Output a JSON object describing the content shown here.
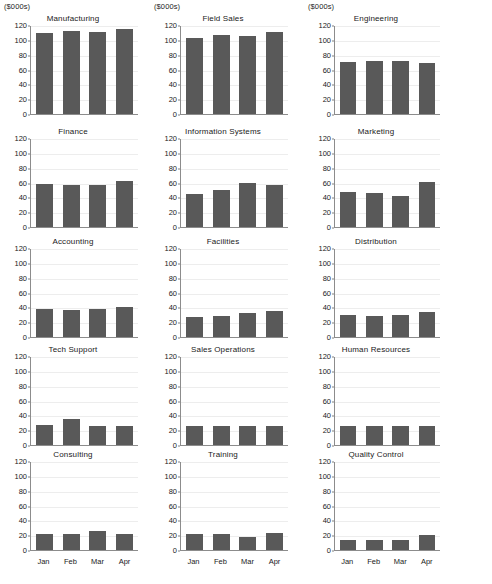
{
  "figure": {
    "units_label": "($000s)",
    "bar_color": "#595959",
    "grid_color": "#ededed",
    "axis_color": "#8c8c8c",
    "background": "#ffffff"
  },
  "chart_data": {
    "type": "bar",
    "title": "",
    "xlabel": "",
    "ylabel": "($000s)",
    "ylim": [
      0,
      120
    ],
    "yticks": [
      0,
      20,
      40,
      60,
      80,
      100,
      120
    ],
    "grid": true,
    "legend": "none",
    "categories": [
      "Jan",
      "Feb",
      "Mar",
      "Apr"
    ],
    "panels": [
      {
        "title": "Manufacturing",
        "values": [
          109,
          112,
          111,
          114
        ]
      },
      {
        "title": "Field Sales",
        "values": [
          103,
          106,
          105,
          110
        ]
      },
      {
        "title": "Engineering",
        "values": [
          70,
          72,
          71,
          69
        ]
      },
      {
        "title": "Finance",
        "values": [
          58,
          57,
          56,
          62
        ]
      },
      {
        "title": "Information Systems",
        "values": [
          44,
          50,
          59,
          56
        ]
      },
      {
        "title": "Marketing",
        "values": [
          47,
          46,
          42,
          61
        ]
      },
      {
        "title": "Accounting",
        "values": [
          38,
          36,
          38,
          41
        ]
      },
      {
        "title": "Facilities",
        "values": [
          27,
          28,
          33,
          35
        ]
      },
      {
        "title": "Distribution",
        "values": [
          30,
          29,
          30,
          34
        ]
      },
      {
        "title": "Tech Support",
        "values": [
          27,
          35,
          25,
          25
        ]
      },
      {
        "title": "Sales Operations",
        "values": [
          25,
          25,
          26,
          26
        ]
      },
      {
        "title": "Human Resources",
        "values": [
          25,
          25,
          26,
          26
        ]
      },
      {
        "title": "Consulting",
        "values": [
          21,
          22,
          25,
          21
        ]
      },
      {
        "title": "Training",
        "values": [
          21,
          22,
          18,
          23
        ]
      },
      {
        "title": "Quality Control",
        "values": [
          14,
          14,
          14,
          20
        ]
      }
    ]
  }
}
